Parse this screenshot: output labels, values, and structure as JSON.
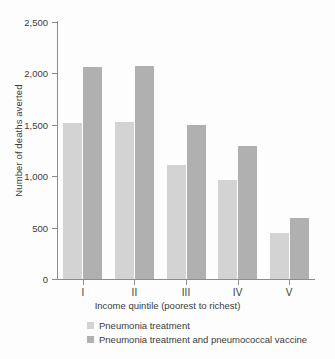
{
  "chart_data": {
    "type": "bar",
    "title": "",
    "xlabel": "Income quintile (poorest to richest)",
    "ylabel": "Number of deaths averted",
    "categories": [
      "I",
      "II",
      "III",
      "IV",
      "V"
    ],
    "ylim": [
      0,
      2500
    ],
    "yticks": [
      0,
      500,
      1000,
      1500,
      2000,
      2500
    ],
    "ytick_labels": [
      "0",
      "500",
      "1,000",
      "1,500",
      "2,000",
      "2,500"
    ],
    "grid": false,
    "legend_position": "bottom-left",
    "series": [
      {
        "name": "Pneumonia treatment",
        "color": "#d3d3d3",
        "values": [
          1520,
          1530,
          1110,
          960,
          445
        ]
      },
      {
        "name": "Pneumonia treatment and pneumococcal vaccine",
        "color": "#b0b0b0",
        "values": [
          2060,
          2075,
          1500,
          1295,
          590
        ]
      }
    ]
  },
  "axis": {
    "line_color": "#8c8c8c"
  },
  "legend": {
    "items": [
      {
        "label": "Pneumonia treatment",
        "color": "#d3d3d3"
      },
      {
        "label": "Pneumonia treatment and pneumococcal vaccine",
        "color": "#b0b0b0"
      }
    ]
  }
}
